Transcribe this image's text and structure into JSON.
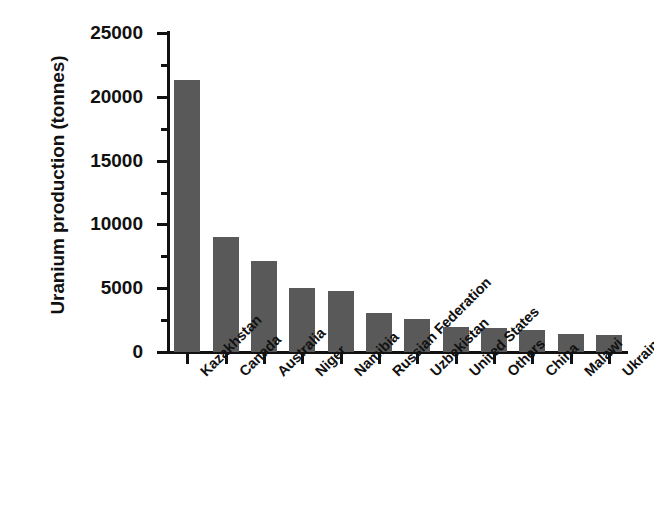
{
  "chart_data": {
    "type": "bar",
    "title": "",
    "subtitle": "",
    "xlabel": "",
    "ylabel": "Uranium production (tonnes)",
    "categories": [
      "Kazakhstan",
      "Canada",
      "Australia",
      "Niger",
      "Namibia",
      "Russian Federation",
      "Uzbekistan",
      "United States",
      "Others",
      "China",
      "Malawi",
      "Ukraine"
    ],
    "values": [
      21300,
      9000,
      7100,
      5000,
      4800,
      3050,
      2600,
      1950,
      1900,
      1700,
      1400,
      1350
    ],
    "ylim": [
      0,
      25000
    ],
    "ytick_labels": [
      "0",
      "5000",
      "10000",
      "15000",
      "20000",
      "25000"
    ],
    "ytick_values": [
      0,
      5000,
      10000,
      15000,
      20000,
      25000
    ],
    "yminor_values": [
      2500,
      7500,
      12500,
      17500,
      22500
    ],
    "grid": false,
    "legend": false,
    "legend_position": "none",
    "bar_color": "#595959",
    "axis_color": "#111111",
    "background_color": "#ffffff"
  }
}
